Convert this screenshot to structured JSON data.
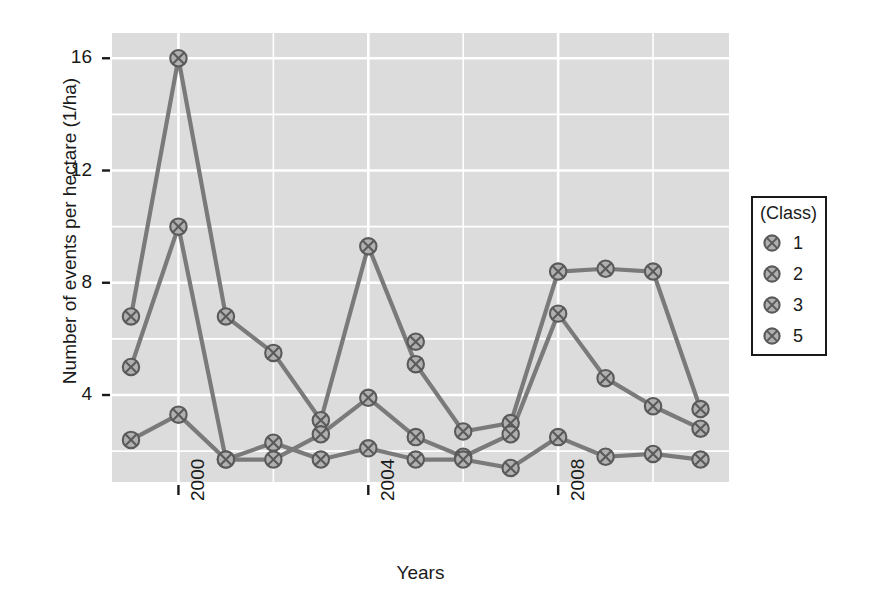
{
  "chart_data": {
    "type": "line",
    "title": "",
    "xlabel": "Years",
    "ylabel": "Number of events per hectare (1/ha)",
    "legend_title": "(Class)",
    "legend_position": "right",
    "grid": true,
    "xlim": [
      1998.6,
      2011.6
    ],
    "ylim": [
      0.9,
      16.9
    ],
    "yticks": [
      4,
      8,
      12,
      16
    ],
    "ytick_labels": [
      "4",
      "8",
      "12",
      "16"
    ],
    "xticks": [
      2000,
      2004,
      2008
    ],
    "xtick_labels": [
      "2000",
      "2004",
      "2008"
    ],
    "x": [
      1999,
      2000,
      2001,
      2002,
      2003,
      2004,
      2005,
      2006,
      2007,
      2008,
      2009,
      2010,
      2011
    ],
    "series": [
      {
        "name": "1",
        "values": [
          6.8,
          16.0,
          6.8,
          5.5,
          3.1,
          9.3,
          5.1,
          2.7,
          3.0,
          8.4,
          8.5,
          8.4,
          3.5
        ]
      },
      {
        "name": "2",
        "values": [
          5.0,
          10.0,
          1.7,
          1.7,
          2.6,
          3.9,
          2.5,
          1.8,
          2.6,
          6.9,
          4.6,
          3.6,
          2.8
        ]
      },
      {
        "name": "3",
        "values": [
          2.4,
          3.3,
          1.7,
          2.3,
          1.7,
          2.1,
          1.7,
          1.7,
          1.4,
          2.5,
          1.8,
          1.9,
          1.7
        ]
      },
      {
        "name": "5",
        "x": [
          2005
        ],
        "values": [
          5.9
        ]
      }
    ],
    "colors": {
      "line": "#7a7a7a",
      "marker_fill": "#b0b0b0",
      "marker_stroke": "#5a5a5a",
      "panel_background": "#dcdcdc",
      "gridline": "#ffffff",
      "text": "#1a1a1a"
    }
  }
}
